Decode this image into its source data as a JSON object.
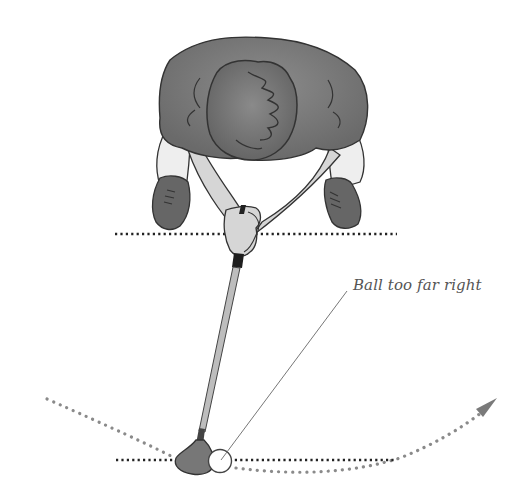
{
  "diagram": {
    "annotation": {
      "label": "Ball too far right"
    },
    "elements": [
      "golfer",
      "golf-club",
      "golf-ball",
      "stance-line",
      "ball-target-line",
      "swing-path-arc",
      "swing-direction-arrow",
      "annotation-leader-line"
    ],
    "colors": {
      "shirt": "#7a7a7a",
      "hair": "#6e6e6e",
      "shoes": "#666666",
      "skin": "#d6d6d6",
      "sleeve": "#eeeeee",
      "outline": "#333333",
      "dotted_line": "#222222",
      "swing_path": "#8a8a8a",
      "text": "#555555",
      "background": "#ffffff"
    }
  }
}
